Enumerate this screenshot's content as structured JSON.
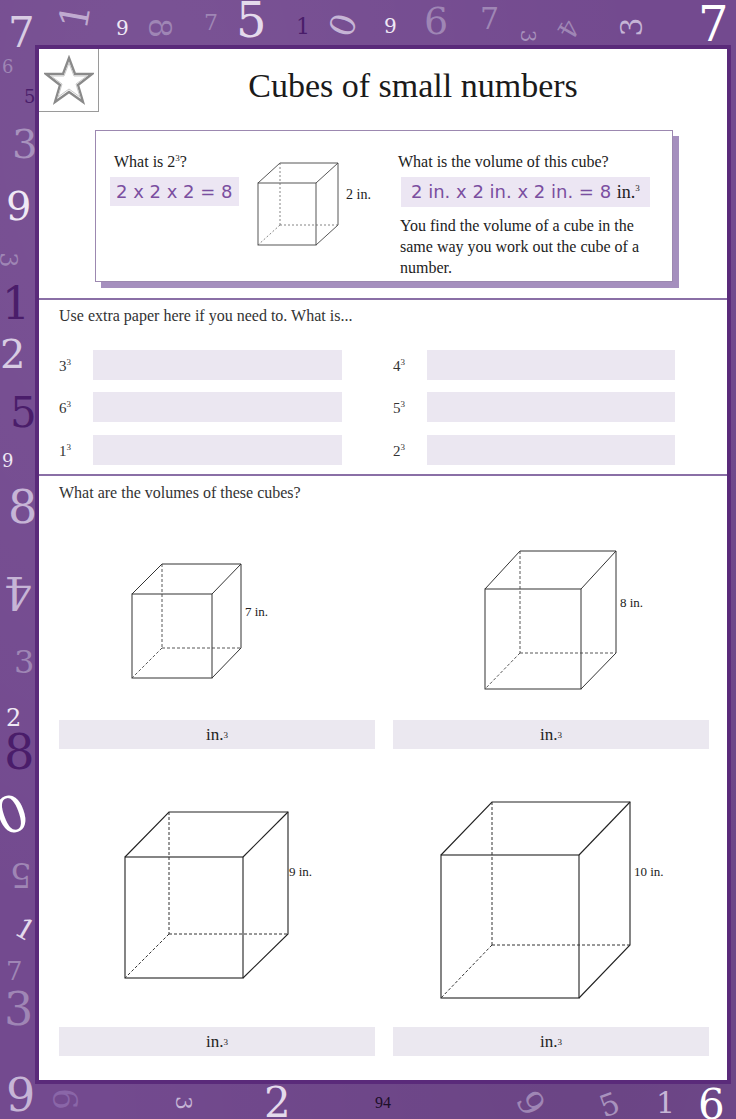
{
  "page": {
    "title": "Cubes of small numbers",
    "page_number": "94",
    "star_icon": "star-icon"
  },
  "intro": {
    "question_1": "What is 2",
    "question_1_suffix": "?",
    "answer_1": "2 x 2 x 2 = 8",
    "example_cube_dimension": "2 in.",
    "question_2": "What is the volume of this cube?",
    "answer_2": "2 in. x 2 in. x 2 in. = 8",
    "answer_2_unit": "in.",
    "explanation": "You find the volume of a cube in the same way you work out the cube of a number."
  },
  "section_1": {
    "instruction": "Use extra paper here if you need to. What is...",
    "items": [
      {
        "base": "3",
        "exponent": "3",
        "answer": ""
      },
      {
        "base": "4",
        "exponent": "3",
        "answer": ""
      },
      {
        "base": "6",
        "exponent": "3",
        "answer": ""
      },
      {
        "base": "5",
        "exponent": "3",
        "answer": ""
      },
      {
        "base": "1",
        "exponent": "3",
        "answer": ""
      },
      {
        "base": "2",
        "exponent": "3",
        "answer": ""
      }
    ]
  },
  "section_2": {
    "instruction": "What are the volumes of these cubes?",
    "cubes": [
      {
        "dimension": "7 in.",
        "unit": "in.",
        "exponent": "3",
        "answer": ""
      },
      {
        "dimension": "8 in.",
        "unit": "in.",
        "exponent": "3",
        "answer": ""
      },
      {
        "dimension": "9 in.",
        "unit": "in.",
        "exponent": "3",
        "answer": ""
      },
      {
        "dimension": "10 in.",
        "unit": "in.",
        "exponent": "3",
        "answer": ""
      }
    ]
  },
  "colors": {
    "border_purple": "#734a8f",
    "frame_dark": "#5a2a7a",
    "answer_fill": "#ebe7f1",
    "handwriting": "#7a4ea0",
    "shadow": "#a58fbe"
  },
  "decor": {
    "top": [
      "7",
      "1",
      "9",
      "8",
      "7",
      "5",
      "1",
      "0",
      "9",
      "6",
      "7",
      "3",
      "4",
      "3",
      "7"
    ],
    "left": [
      "6",
      "5",
      "3",
      "9",
      "3",
      "1",
      "2",
      "5",
      "9",
      "8",
      "4",
      "3",
      "2",
      "8",
      "0",
      "5",
      "1",
      "7",
      "3",
      "9"
    ],
    "bottom": [
      "9",
      "6",
      "3",
      "2",
      "9",
      "5",
      "1",
      "6"
    ]
  }
}
